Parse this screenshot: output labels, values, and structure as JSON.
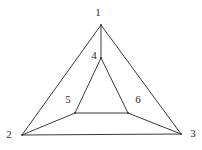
{
  "diagram": {
    "type": "graph",
    "nodes": [
      {
        "id": "1",
        "label": "1",
        "x": 101,
        "y": 25,
        "label_x": 98,
        "label_y": 13
      },
      {
        "id": "2",
        "label": "2",
        "x": 22,
        "y": 135,
        "label_x": 9,
        "label_y": 135
      },
      {
        "id": "3",
        "label": "3",
        "x": 181,
        "y": 134,
        "label_x": 193,
        "label_y": 134
      },
      {
        "id": "4",
        "label": "4",
        "x": 101,
        "y": 58,
        "label_x": 94,
        "label_y": 56
      },
      {
        "id": "5",
        "label": "5",
        "x": 75,
        "y": 113,
        "label_x": 68,
        "label_y": 100
      },
      {
        "id": "6",
        "label": "6",
        "x": 128,
        "y": 113,
        "label_x": 138,
        "label_y": 100
      }
    ],
    "edges": [
      {
        "from": "1",
        "to": "2"
      },
      {
        "from": "1",
        "to": "3"
      },
      {
        "from": "2",
        "to": "3"
      },
      {
        "from": "1",
        "to": "4"
      },
      {
        "from": "4",
        "to": "5"
      },
      {
        "from": "4",
        "to": "6"
      },
      {
        "from": "5",
        "to": "6"
      },
      {
        "from": "2",
        "to": "5"
      },
      {
        "from": "3",
        "to": "6"
      }
    ],
    "colors": {
      "stroke": "#3a3a3a",
      "label": "#2a2a2a",
      "background": "#ffffff"
    }
  }
}
